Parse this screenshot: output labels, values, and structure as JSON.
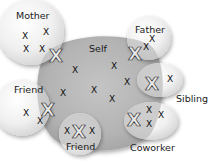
{
  "diagram": {
    "center": {
      "label": "Self",
      "color": "#b7b7b7",
      "marks": [
        {
          "x": 75,
          "y": 73,
          "t": "x"
        },
        {
          "x": 114,
          "y": 69,
          "t": "x"
        },
        {
          "x": 127,
          "y": 85,
          "t": "x"
        },
        {
          "x": 94,
          "y": 93,
          "t": "x"
        },
        {
          "x": 63,
          "y": 96,
          "t": "x"
        },
        {
          "x": 112,
          "y": 102,
          "t": "x"
        }
      ]
    },
    "circles": [
      {
        "id": "mother",
        "label": "Mother",
        "marks_small": [
          [
            25,
            39
          ],
          [
            46,
            35
          ],
          [
            26,
            52
          ],
          [
            42,
            52
          ]
        ],
        "mark_big": [
          56,
          56
        ]
      },
      {
        "id": "father",
        "label": "Father",
        "marks_small": [
          [
            152,
            42
          ],
          [
            146,
            50
          ]
        ],
        "mark_big": [
          135,
          54
        ]
      },
      {
        "id": "sibling",
        "label": "Sibling",
        "marks_small": [
          [
            170,
            82
          ]
        ],
        "mark_big": [
          152,
          84
        ]
      },
      {
        "id": "coworker",
        "label": "Coworker",
        "marks_small": [
          [
            149,
            113
          ],
          [
            161,
            118
          ],
          [
            149,
            127
          ]
        ],
        "mark_big": [
          134,
          120
        ]
      },
      {
        "id": "friend-bottom",
        "label": "Friend",
        "marks_small": [
          [
            67,
            134
          ],
          [
            92,
            134
          ]
        ],
        "mark_big": [
          79,
          132
        ]
      },
      {
        "id": "friend-left",
        "label": "Friend",
        "marks_small": [
          [
            26,
            116
          ],
          [
            40,
            124
          ]
        ],
        "mark_big": [
          48,
          110
        ]
      }
    ],
    "glyphs": {
      "small": "X",
      "big": "X"
    }
  }
}
